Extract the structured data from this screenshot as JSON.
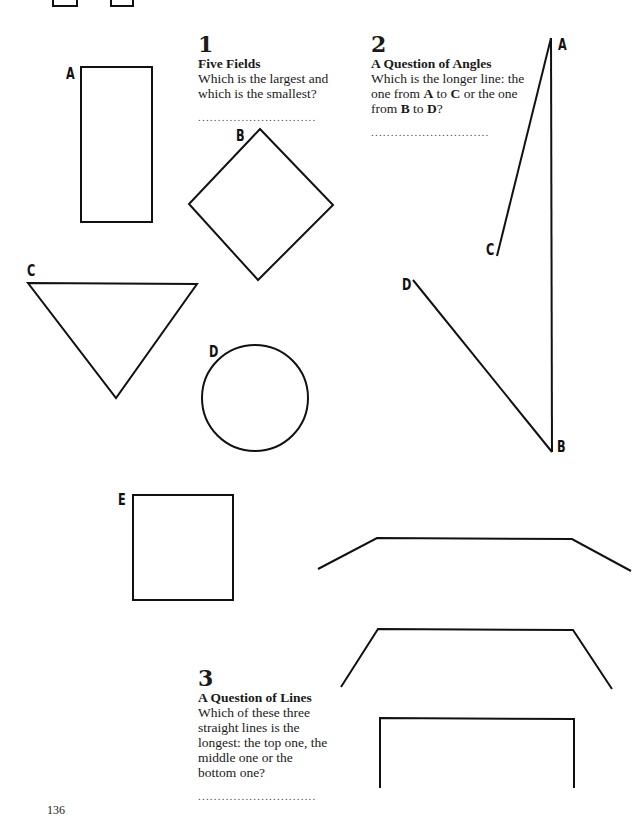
{
  "page_number": "136",
  "puzzles": [
    {
      "number": "1",
      "title": "Five Fields",
      "text": "Which is the largest and which is the smallest?",
      "answer_line": "..............................",
      "shapes": [
        {
          "label": "A",
          "kind": "rectangle"
        },
        {
          "label": "B",
          "kind": "diamond"
        },
        {
          "label": "C",
          "kind": "triangle"
        },
        {
          "label": "D",
          "kind": "circle"
        },
        {
          "label": "E",
          "kind": "square"
        }
      ]
    },
    {
      "number": "2",
      "title": "A Question of Angles",
      "text_parts": [
        "Which is the longer line: the one from ",
        "A",
        " to ",
        "C",
        " or the one from ",
        "B",
        " to ",
        "D",
        "?"
      ],
      "answer_line": "..............................",
      "points": [
        "A",
        "B",
        "C",
        "D"
      ]
    },
    {
      "number": "3",
      "title": "A Question of Lines",
      "text": "Which of these three straight lines is the longest: the top one, the middle one or the bottom one?",
      "answer_line": "..............................",
      "lines": [
        "top",
        "middle",
        "bottom"
      ]
    }
  ]
}
